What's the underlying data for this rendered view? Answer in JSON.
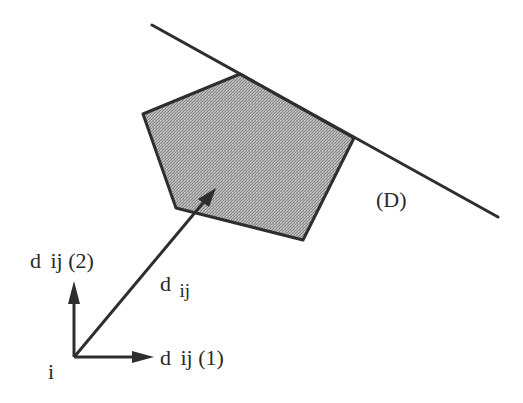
{
  "diagram": {
    "type": "geometric-illustration",
    "colors": {
      "stroke": "#2e2e2e",
      "fill_gray": "#a9a9a9",
      "fill_dark": "#8a8a8a",
      "fill_light": "#c8c8c8",
      "background": "#ffffff"
    },
    "polygon": {
      "shape": "pentagon",
      "points": [
        [
          240,
          74
        ],
        [
          354,
          138
        ],
        [
          303,
          240
        ],
        [
          176,
          208
        ],
        [
          143,
          114
        ]
      ]
    },
    "line_D": {
      "label": "(D)",
      "from": [
        152,
        25
      ],
      "to": [
        498,
        217
      ]
    },
    "origin": {
      "label": "i",
      "point": [
        74,
        357
      ]
    },
    "vector_dij": {
      "label_main": "d",
      "label_sub": "ij",
      "from": [
        74,
        357
      ],
      "to": [
        215,
        189
      ]
    },
    "axis_1": {
      "label": "d ij (1)",
      "label_main": "d",
      "label_rest": "ij (1)",
      "to": [
        152,
        357
      ]
    },
    "axis_2": {
      "label": "d ij (2)",
      "label_main": "d",
      "label_rest": "ij (2)",
      "to": [
        74,
        282
      ]
    }
  }
}
